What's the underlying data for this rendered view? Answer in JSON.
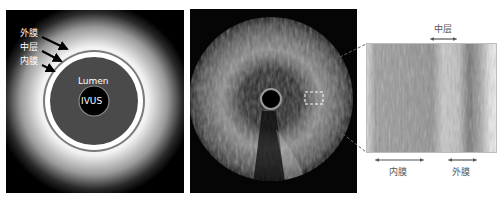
{
  "schematic": {
    "labels": {
      "adventitia": "外膜",
      "media": "中层",
      "intima": "内膜",
      "lumen": "Lumen",
      "catheter": "IVUS"
    },
    "colors": {
      "background": "#000000",
      "halo": "#ffffff",
      "vessel_wall": "#7a7a7a",
      "lumen": "#4a4a4a",
      "catheter": "#000000"
    }
  },
  "ultrasound": {
    "description": "IVUS cross-sectional grayscale image with highlighted region"
  },
  "histology": {
    "labels": {
      "media": "中层",
      "intima": "内膜",
      "adventitia": "外膜"
    }
  }
}
